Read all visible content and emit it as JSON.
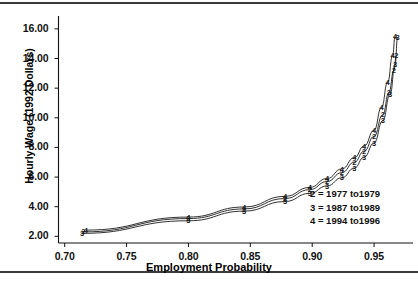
{
  "figure": {
    "background": "#ffffff",
    "ink_color": "#1a1a1a",
    "rule_color": "#3a3a3a"
  },
  "legend": {
    "position": "inside-bottom-right",
    "entries": [
      {
        "marker": "2",
        "label": "2 = 1977 to1979"
      },
      {
        "marker": "3",
        "label": "3 = 1987 to1989"
      },
      {
        "marker": "4",
        "label": "4 = 1994 to1996"
      }
    ]
  },
  "chart_data": {
    "type": "line",
    "title": "",
    "subtitle": "",
    "xlabel": "Employment Probability",
    "ylabel": "Hourly Wage (1992 Dollars)",
    "xlim": [
      0.695,
      0.975
    ],
    "ylim": [
      1.55,
      16.6
    ],
    "grid": false,
    "legend_position": "inside-bottom-right",
    "xticks": [
      0.7,
      0.75,
      0.8,
      0.85,
      0.9,
      0.95
    ],
    "xticklabels": [
      "0.70",
      "0.75",
      "0.80",
      "0.85",
      "0.90",
      "0.95"
    ],
    "yticks": [
      2.0,
      4.0,
      6.0,
      8.0,
      10.0,
      12.0,
      14.0,
      16.0
    ],
    "yticklabels": [
      "2.00",
      "4.00",
      "6.00",
      "8.00",
      "10.00",
      "12.00",
      "14.00",
      "16.00"
    ],
    "marker_style": "series-digit-character",
    "series": [
      {
        "name": "2 = 1977 to1979",
        "marker": "2",
        "x": [
          0.715,
          0.8,
          0.845,
          0.878,
          0.898,
          0.912,
          0.924,
          0.934,
          0.942,
          0.95,
          0.957,
          0.962,
          0.966,
          0.968
        ],
        "values": [
          2.3,
          3.2,
          3.85,
          4.55,
          5.15,
          5.7,
          6.3,
          7.0,
          7.75,
          8.75,
          10.2,
          11.7,
          13.2,
          14.2
        ]
      },
      {
        "name": "3 = 1987 to1989",
        "marker": "3",
        "x": [
          0.714,
          0.8,
          0.845,
          0.878,
          0.898,
          0.912,
          0.924,
          0.934,
          0.942,
          0.95,
          0.957,
          0.963,
          0.967,
          0.969
        ],
        "values": [
          2.2,
          3.05,
          3.7,
          4.35,
          4.9,
          5.4,
          5.95,
          6.6,
          7.35,
          8.3,
          9.8,
          11.6,
          13.6,
          15.4
        ]
      },
      {
        "name": "4 = 1994 to1996",
        "marker": "4",
        "x": [
          0.717,
          0.8,
          0.845,
          0.878,
          0.898,
          0.912,
          0.924,
          0.934,
          0.942,
          0.95,
          0.956,
          0.961,
          0.965,
          0.967
        ],
        "values": [
          2.42,
          3.3,
          3.98,
          4.7,
          5.3,
          5.9,
          6.55,
          7.3,
          8.1,
          9.15,
          10.7,
          12.4,
          14.2,
          15.5
        ]
      }
    ]
  }
}
